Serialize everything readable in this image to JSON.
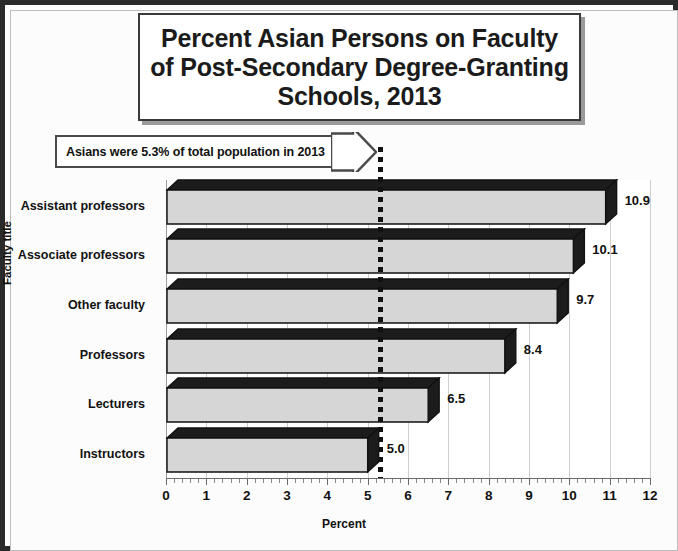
{
  "chart_data": {
    "type": "bar",
    "orientation": "horizontal",
    "title": "Percent Asian Persons on Faculty of Post-Secondary Degree-Granting Schools, 2013",
    "title_lines": [
      "Percent Asian Persons on Faculty",
      "of Post-Secondary Degree-Granting",
      "Schools, 2013"
    ],
    "xlabel": "Percent",
    "ylabel": "Faculty title",
    "xlim": [
      0,
      12
    ],
    "xticks": [
      0,
      1,
      2,
      3,
      4,
      5,
      6,
      7,
      8,
      9,
      10,
      11,
      12
    ],
    "xtick_labels": [
      "0",
      "1",
      "2",
      "3",
      "4",
      "5",
      "6",
      "7",
      "8",
      "9",
      "10",
      "11",
      "12"
    ],
    "minor_ticks_per_interval": 5,
    "grid": "vertical-light",
    "legend": "none",
    "categories": [
      "Assistant professors",
      "Associate professors",
      "Other faculty",
      "Professors",
      "Lecturers",
      "Instructors"
    ],
    "values": [
      10.9,
      10.1,
      9.7,
      8.4,
      6.5,
      5.0
    ],
    "value_labels": [
      "10.9",
      "10.1",
      "9.7",
      "8.4",
      "6.5",
      "5.0"
    ],
    "annotation": {
      "text": "Asians were 5.3% of total population in 2013",
      "reference_value": 5.3,
      "reference_line_style": "dotted",
      "reference_line_color": "#111111",
      "shape": "right-arrow-callout"
    },
    "colors": {
      "bar_face": "#d6d6d6",
      "bar_shade": "#1c1c1c",
      "bar_outline": "#111111",
      "background": "#ffffff",
      "frame": "#2a2a2a",
      "gridline": "#cfcfcf",
      "text": "#111111"
    }
  }
}
